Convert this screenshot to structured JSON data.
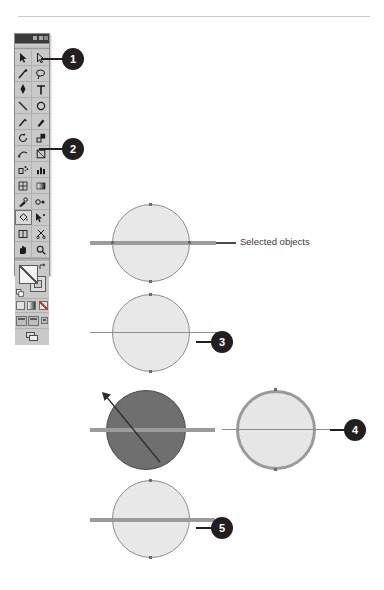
{
  "page": {
    "background_color": "#ffffff",
    "rule_color": "#c9c9c9"
  },
  "toolbar": {
    "name": "Tools palette",
    "title_bar": {
      "window_buttons": [
        "minimize-button",
        "maximize-button",
        "close-button"
      ]
    },
    "tools": [
      {
        "row": 1,
        "left": "selection-tool",
        "right": "direct-selection-tool"
      },
      {
        "row": 2,
        "left": "magic-wand-tool",
        "right": "lasso-tool"
      },
      {
        "row": 3,
        "left": "pen-tool",
        "right": "type-tool"
      },
      {
        "row": 4,
        "left": "line-segment-tool",
        "right": "ellipse-tool"
      },
      {
        "row": 5,
        "left": "paintbrush-tool",
        "right": "pencil-tool"
      },
      {
        "row": 6,
        "left": "rotate-tool",
        "right": "scale-tool"
      },
      {
        "row": 7,
        "left": "warp-tool",
        "right": "free-transform-tool"
      },
      {
        "row": 8,
        "left": "symbol-sprayer-tool",
        "right": "column-graph-tool"
      },
      {
        "row": 9,
        "left": "mesh-tool",
        "right": "gradient-tool"
      },
      {
        "row": 10,
        "left": "eyedropper-tool",
        "right": "blend-tool"
      },
      {
        "row": 11,
        "left": "live-paint-bucket-tool",
        "right": "live-paint-selection-tool"
      },
      {
        "row": 12,
        "left": "slice-tool",
        "right": "scissors-tool"
      },
      {
        "row": 13,
        "left": "hand-tool",
        "right": "zoom-tool"
      }
    ],
    "fill_stroke": {
      "fill_swatch": "fill-swatch",
      "stroke_swatch": "stroke-swatch",
      "swap_icon": "swap-fill-stroke-icon",
      "default_icon": "default-fill-stroke-icon"
    },
    "color_modes": [
      "color-mode-button",
      "gradient-mode-button",
      "none-mode-button"
    ],
    "screen_modes": [
      "normal-screen-mode",
      "full-screen-with-menu-mode",
      "full-screen-mode"
    ],
    "bottom_control": "change-screen-mode-button"
  },
  "annotations": {
    "label": "Selected objects",
    "callouts": [
      {
        "number": "1",
        "target": "direct-selection-tool"
      },
      {
        "number": "2",
        "target": "live-paint-selection-tool"
      },
      {
        "number": "3",
        "target": "second-circle-path"
      },
      {
        "number": "4",
        "target": "stroked-circle"
      },
      {
        "number": "5",
        "target": "bottom-circle-path"
      }
    ]
  },
  "figures": [
    {
      "id": "figure-1",
      "name": "selected-objects-circle",
      "fill": "#e8e8e8",
      "stroke": "#8c8c8c",
      "path_line": "thick",
      "has_label": true
    },
    {
      "id": "figure-2",
      "name": "second-circle",
      "fill": "#e8e8e8",
      "stroke": "#8c8c8c",
      "path_line": "thin",
      "callout": "3"
    },
    {
      "id": "figure-3a",
      "name": "darkened-circle",
      "fill": "#6f6f6f",
      "stroke": "#4a4a4a",
      "path_line": "thick",
      "has_diagonal_drag": true
    },
    {
      "id": "figure-3b",
      "name": "stroked-circle",
      "fill": "#e6e6e6",
      "stroke": "#9a9a9a",
      "stroke_width": "3px",
      "path_line": "thin",
      "callout": "4"
    },
    {
      "id": "figure-4",
      "name": "bottom-circle",
      "fill": "#e8e8e8",
      "stroke": "#8c8c8c",
      "path_line": "thin",
      "callout": "5"
    }
  ]
}
